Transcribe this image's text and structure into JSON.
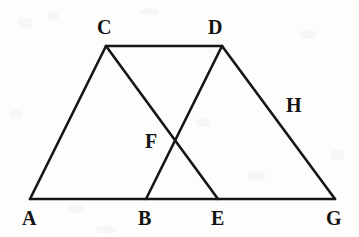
{
  "figure": {
    "kind": "geometry-line-diagram",
    "width": 359,
    "height": 237,
    "background_color": "#fdfdfc",
    "stroke_color": "#161616",
    "stroke_width": 2.6,
    "label_color": "#131313",
    "points": [
      {
        "id": "A",
        "label": "A",
        "x": 30,
        "y": 199
      },
      {
        "id": "B",
        "label": "B",
        "x": 146,
        "y": 199
      },
      {
        "id": "E",
        "label": "E",
        "x": 218,
        "y": 199
      },
      {
        "id": "G",
        "label": "G",
        "x": 335,
        "y": 199
      },
      {
        "id": "C",
        "label": "C",
        "x": 106,
        "y": 46
      },
      {
        "id": "D",
        "label": "D",
        "x": 222,
        "y": 46
      },
      {
        "id": "F",
        "label": "F",
        "x": 173,
        "y": 138
      }
    ],
    "segments": [
      {
        "id": "AG",
        "from": "A",
        "to": "G",
        "name": "baseline-a-g"
      },
      {
        "id": "CD",
        "from": "C",
        "to": "D",
        "name": "top-c-d"
      },
      {
        "id": "AC",
        "from": "A",
        "to": "C",
        "name": "left-side-a-c"
      },
      {
        "id": "CE",
        "from": "C",
        "to": "E",
        "name": "cevian-c-e"
      },
      {
        "id": "DB",
        "from": "D",
        "to": "B",
        "name": "cevian-d-b"
      },
      {
        "id": "DG",
        "from": "D",
        "to": "G",
        "name": "right-side-d-g"
      }
    ],
    "labels": [
      {
        "id": "A",
        "text": "A",
        "x": 22,
        "y": 208,
        "name": "point-label-a"
      },
      {
        "id": "B",
        "text": "B",
        "x": 138,
        "y": 208,
        "name": "point-label-b"
      },
      {
        "id": "E",
        "text": "E",
        "x": 211,
        "y": 208,
        "name": "point-label-e"
      },
      {
        "id": "G",
        "text": "G",
        "x": 326,
        "y": 208,
        "name": "point-label-g"
      },
      {
        "id": "C",
        "text": "C",
        "x": 97,
        "y": 17,
        "name": "point-label-c"
      },
      {
        "id": "D",
        "text": "D",
        "x": 208,
        "y": 17,
        "name": "point-label-d"
      },
      {
        "id": "F",
        "text": "F",
        "x": 145,
        "y": 131,
        "name": "point-label-f"
      },
      {
        "id": "H",
        "text": "H",
        "x": 286,
        "y": 95,
        "name": "segment-label-h"
      }
    ]
  }
}
